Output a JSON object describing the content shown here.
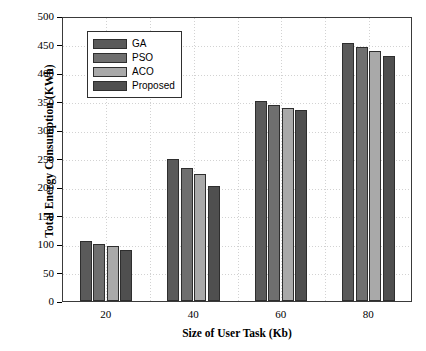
{
  "chart_data": {
    "type": "bar",
    "title": "",
    "xlabel": "Size of User Task (Kb)",
    "ylabel": "Total Energy Consumption (KWh)",
    "categories": [
      "20",
      "40",
      "60",
      "80"
    ],
    "ylim": [
      0,
      500
    ],
    "yticks": [
      0,
      50,
      100,
      150,
      200,
      250,
      300,
      350,
      400,
      450,
      500
    ],
    "ytick_labels": [
      "0",
      "50",
      "100",
      "150",
      "200",
      "250",
      "300",
      "350",
      "400",
      "450",
      "500"
    ],
    "grid": true,
    "legend_position": "upper left",
    "series": [
      {
        "name": "GA",
        "color": "#5a5a5a",
        "values": [
          106,
          250,
          351,
          452
        ]
      },
      {
        "name": "PSO",
        "color": "#6f6f6f",
        "values": [
          100,
          233,
          344,
          445
        ]
      },
      {
        "name": "ACO",
        "color": "#a9a9a9",
        "values": [
          97,
          222,
          339,
          438
        ]
      },
      {
        "name": "Proposed",
        "color": "#4f4f4f",
        "values": [
          90,
          202,
          335,
          430
        ]
      }
    ]
  },
  "legend": {
    "items": [
      {
        "label": "GA"
      },
      {
        "label": "PSO"
      },
      {
        "label": "ACO"
      },
      {
        "label": "Proposed"
      }
    ]
  }
}
